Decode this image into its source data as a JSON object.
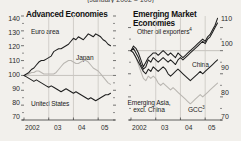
{
  "figure": {
    "clipped_title": "(January 2002 = 100)",
    "background": "#f2f0ec",
    "dark_series_color": "#1f1f1f",
    "light_series_color": "#b9b6b1"
  },
  "panels": [
    {
      "id": "advanced",
      "title": "Advanced Economies",
      "y_axis": {
        "side": "left",
        "ticks": [
          140,
          130,
          120,
          110,
          100,
          90,
          80,
          70
        ],
        "min": 70,
        "max": 140
      },
      "x_axis": {
        "ticks": [
          "2002",
          "03",
          "04",
          "05"
        ],
        "min": 2002.0,
        "max": 2005.6
      },
      "series_labels": [
        {
          "name": "Euro area",
          "text": "Euro area"
        },
        {
          "name": "Japan",
          "text": "Japan"
        },
        {
          "name": "United States",
          "text": "United States"
        }
      ]
    },
    {
      "id": "emerging",
      "title": "Emerging Market Economies",
      "y_axis": {
        "side": "right",
        "ticks": [
          110,
          100,
          90,
          80,
          70
        ],
        "min": 70,
        "max": 115
      },
      "x_axis": {
        "ticks": [
          "2002",
          "03",
          "04",
          "05"
        ],
        "min": 2002.0,
        "max": 2005.6
      },
      "series_labels": [
        {
          "name": "Other oil exporters",
          "text": "Other oil exporters",
          "footnote": "4"
        },
        {
          "name": "China",
          "text": "China"
        },
        {
          "name": "Emerging Asia excl China",
          "text": "Emerging Asia, excl. China"
        },
        {
          "name": "GCC",
          "text": "GCC",
          "footnote": "3"
        }
      ]
    }
  ],
  "chart_data": [
    {
      "type": "line",
      "title": "Advanced Economies",
      "subtitle": "(January 2002 = 100)",
      "xlabel": "",
      "ylabel": "",
      "ylim": [
        70,
        140
      ],
      "yticks": [
        140,
        130,
        120,
        110,
        100,
        90,
        80,
        70
      ],
      "xticks": [
        2002,
        2003,
        2004,
        2005
      ],
      "xticklabels": [
        "2002",
        "03",
        "04",
        "05"
      ],
      "xlim": [
        2002.0,
        2005.6
      ],
      "grid": false,
      "legend": "inline-labels",
      "series": [
        {
          "name": "Euro area",
          "color": "#1f1f1f",
          "x": [
            2002.0,
            2002.1,
            2002.2,
            2002.3,
            2002.4,
            2002.5,
            2002.6,
            2002.7,
            2002.8,
            2002.9,
            2003.0,
            2003.1,
            2003.2,
            2003.3,
            2003.4,
            2003.5,
            2003.6,
            2003.7,
            2003.8,
            2003.9,
            2004.0,
            2004.1,
            2004.2,
            2004.3,
            2004.4,
            2004.5,
            2004.6,
            2004.7,
            2004.8,
            2004.9,
            2005.0,
            2005.1,
            2005.2,
            2005.3,
            2005.4,
            2005.5
          ],
          "values": [
            100,
            101,
            102,
            104,
            105,
            107,
            109,
            110,
            110,
            111,
            112,
            113,
            116,
            117,
            118,
            118,
            119,
            120,
            121,
            123,
            125,
            124,
            126,
            125,
            124,
            126,
            128,
            127,
            126,
            128,
            127,
            126,
            124,
            123,
            121,
            120
          ]
        },
        {
          "name": "Japan",
          "color": "#b9b6b1",
          "x": [
            2002.0,
            2002.1,
            2002.2,
            2002.3,
            2002.4,
            2002.5,
            2002.6,
            2002.7,
            2002.8,
            2002.9,
            2003.0,
            2003.1,
            2003.2,
            2003.3,
            2003.4,
            2003.5,
            2003.6,
            2003.7,
            2003.8,
            2003.9,
            2004.0,
            2004.1,
            2004.2,
            2004.3,
            2004.4,
            2004.5,
            2004.6,
            2004.7,
            2004.8,
            2004.9,
            2005.0,
            2005.1,
            2005.2,
            2005.3,
            2005.4,
            2005.5
          ],
          "values": [
            100,
            100,
            101,
            102,
            102,
            103,
            103,
            102,
            101,
            101,
            101,
            101,
            101,
            102,
            104,
            106,
            108,
            109,
            110,
            110,
            109,
            108,
            108,
            109,
            110,
            110,
            109,
            107,
            105,
            104,
            103,
            101,
            99,
            97,
            95,
            94
          ]
        },
        {
          "name": "United States",
          "color": "#1f1f1f",
          "x": [
            2002.0,
            2002.1,
            2002.2,
            2002.3,
            2002.4,
            2002.5,
            2002.6,
            2002.7,
            2002.8,
            2002.9,
            2003.0,
            2003.1,
            2003.2,
            2003.3,
            2003.4,
            2003.5,
            2003.6,
            2003.7,
            2003.8,
            2003.9,
            2004.0,
            2004.1,
            2004.2,
            2004.3,
            2004.4,
            2004.5,
            2004.6,
            2004.7,
            2004.8,
            2004.9,
            2005.0,
            2005.1,
            2005.2,
            2005.3,
            2005.4,
            2005.5
          ],
          "values": [
            100,
            99,
            98,
            97,
            96,
            97,
            96,
            95,
            94,
            93,
            92,
            93,
            92,
            91,
            90,
            89,
            90,
            91,
            90,
            89,
            88,
            89,
            88,
            87,
            86,
            85,
            84,
            85,
            84,
            83,
            84,
            85,
            86,
            87,
            87,
            88
          ]
        }
      ]
    },
    {
      "type": "line",
      "title": "Emerging Market Economies",
      "subtitle": "(January 2002 = 100)",
      "xlabel": "",
      "ylabel": "",
      "ylim": [
        70,
        115
      ],
      "yticks": [
        110,
        100,
        90,
        80,
        70
      ],
      "xticks": [
        2002,
        2003,
        2004,
        2005
      ],
      "xticklabels": [
        "2002",
        "03",
        "04",
        "05"
      ],
      "xlim": [
        2002.0,
        2005.6
      ],
      "grid": false,
      "legend": "inline-labels",
      "series": [
        {
          "name": "Other oil exporters",
          "footnote": "4",
          "color": "#1f1f1f",
          "x": [
            2002.0,
            2002.1,
            2002.2,
            2002.3,
            2002.4,
            2002.5,
            2002.6,
            2002.7,
            2002.8,
            2002.9,
            2003.0,
            2003.1,
            2003.2,
            2003.3,
            2003.4,
            2003.5,
            2003.6,
            2003.7,
            2003.8,
            2003.9,
            2004.0,
            2004.1,
            2004.2,
            2004.3,
            2004.4,
            2004.5,
            2004.6,
            2004.7,
            2004.8,
            2004.9,
            2005.0,
            2005.1,
            2005.2,
            2005.3,
            2005.4,
            2005.5
          ],
          "values": [
            100,
            102,
            101,
            99,
            96,
            93,
            95,
            97,
            98,
            99,
            99,
            98,
            99,
            100,
            99,
            98,
            99,
            98,
            97,
            99,
            98,
            97,
            98,
            99,
            100,
            101,
            102,
            103,
            104,
            105,
            104,
            106,
            107,
            109,
            111,
            114
          ]
        },
        {
          "name": "China",
          "color": "#1f1f1f",
          "x": [
            2002.0,
            2002.1,
            2002.2,
            2002.3,
            2002.4,
            2002.5,
            2002.6,
            2002.7,
            2002.8,
            2002.9,
            2003.0,
            2003.1,
            2003.2,
            2003.3,
            2003.4,
            2003.5,
            2003.6,
            2003.7,
            2003.8,
            2003.9,
            2004.0,
            2004.1,
            2004.2,
            2004.3,
            2004.4,
            2004.5,
            2004.6,
            2004.7,
            2004.8,
            2004.9,
            2005.0,
            2005.1,
            2005.2,
            2005.3,
            2005.4,
            2005.5
          ],
          "values": [
            100,
            99,
            97,
            95,
            93,
            91,
            90,
            92,
            91,
            93,
            92,
            91,
            92,
            93,
            92,
            90,
            89,
            90,
            91,
            92,
            91,
            90,
            89,
            88,
            87,
            88,
            89,
            90,
            91,
            90,
            91,
            92,
            93,
            94,
            95,
            96
          ]
        },
        {
          "name": "Emerging Asia, excl. China",
          "color": "#1f1f1f",
          "x": [
            2002.0,
            2002.1,
            2002.2,
            2002.3,
            2002.4,
            2002.5,
            2002.6,
            2002.7,
            2002.8,
            2002.9,
            2003.0,
            2003.1,
            2003.2,
            2003.3,
            2003.4,
            2003.5,
            2003.6,
            2003.7,
            2003.8,
            2003.9,
            2004.0,
            2004.1,
            2004.2,
            2004.3,
            2004.4,
            2004.5,
            2004.6,
            2004.7,
            2004.8,
            2004.9,
            2005.0,
            2005.1,
            2005.2,
            2005.3,
            2005.4,
            2005.5
          ],
          "values": [
            100,
            101,
            99,
            97,
            94,
            92,
            93,
            96,
            95,
            97,
            96,
            95,
            96,
            97,
            96,
            95,
            96,
            95,
            94,
            96,
            97,
            96,
            97,
            98,
            99,
            100,
            101,
            102,
            103,
            104,
            103,
            105,
            106,
            108,
            110,
            112
          ]
        },
        {
          "name": "GCC",
          "footnote": "3",
          "color": "#b9b6b1",
          "x": [
            2002.0,
            2002.1,
            2002.2,
            2002.3,
            2002.4,
            2002.5,
            2002.6,
            2002.7,
            2002.8,
            2002.9,
            2003.0,
            2003.1,
            2003.2,
            2003.3,
            2003.4,
            2003.5,
            2003.6,
            2003.7,
            2003.8,
            2003.9,
            2004.0,
            2004.1,
            2004.2,
            2004.3,
            2004.4,
            2004.5,
            2004.6,
            2004.7,
            2004.8,
            2004.9,
            2005.0,
            2005.1,
            2005.2,
            2005.3,
            2005.4,
            2005.5
          ],
          "values": [
            100,
            99,
            97,
            94,
            91,
            88,
            87,
            89,
            88,
            89,
            88,
            86,
            85,
            86,
            85,
            84,
            83,
            84,
            83,
            82,
            81,
            80,
            79,
            78,
            77,
            78,
            79,
            80,
            81,
            80,
            81,
            82,
            83,
            84,
            85,
            86
          ]
        }
      ]
    }
  ]
}
